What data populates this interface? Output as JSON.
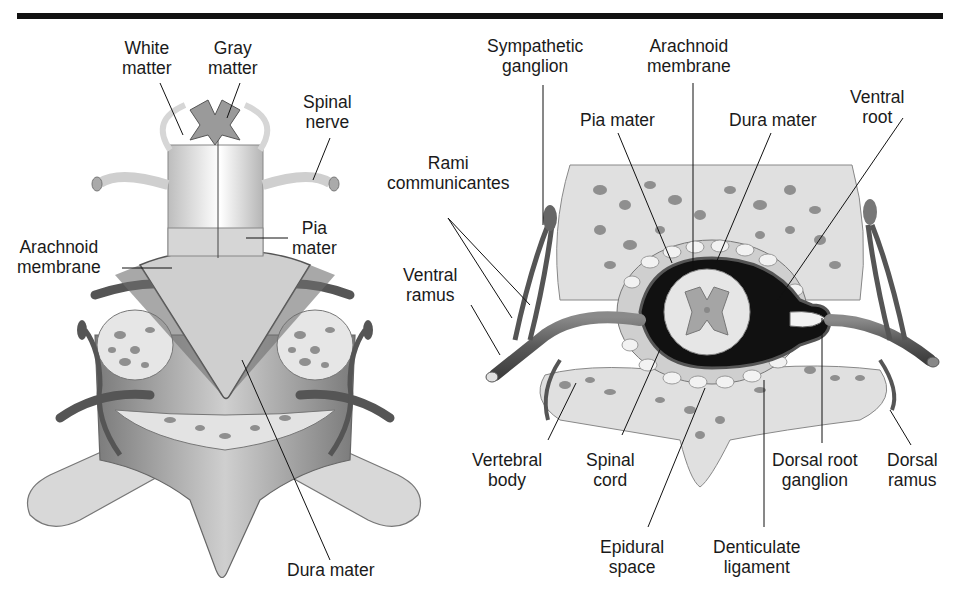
{
  "figure": {
    "left_panel": {
      "name": "spinal cord with meninges (posterior oblique view)",
      "labels": {
        "white_matter": "White\nmatter",
        "gray_matter": "Gray\nmatter",
        "spinal_nerve": "Spinal\nnerve",
        "pia_mater": "Pia\nmater",
        "arachnoid_membrane": "Arachnoid\nmembrane",
        "dura_mater": "Dura mater"
      }
    },
    "right_panel": {
      "name": "transverse section of spinal cord in vertebra",
      "labels": {
        "sympathetic_ganglion": "Sympathetic\nganglion",
        "arachnoid_membrane": "Arachnoid\nmembrane",
        "ventral_root": "Ventral\nroot",
        "pia_mater": "Pia mater",
        "dura_mater": "Dura mater",
        "rami_communicantes": "Rami\ncommunicantes",
        "ventral_ramus": "Ventral\nramus",
        "vertebral_body": "Vertebral\nbody",
        "spinal_cord": "Spinal\ncord",
        "epidural_space": "Epidural\nspace",
        "denticulate_ligament": "Denticulate\nligament",
        "dorsal_root_ganglion": "Dorsal root\nganglion",
        "dorsal_ramus": "Dorsal\nramus"
      }
    },
    "colors": {
      "bone": "#e3e3e3",
      "bone_spots": "#8f8f8f",
      "tissue_dark": "#6a6a6a",
      "dura": "#9a9a9a",
      "line": "#111111"
    }
  }
}
